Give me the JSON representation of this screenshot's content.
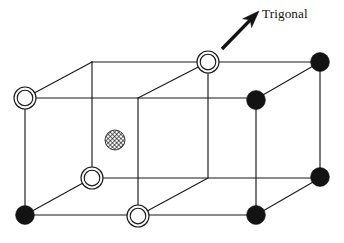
{
  "figure": {
    "kind": "crystal-lattice-diagram",
    "background_color": "#ffffff",
    "line_color": "#1a1a1a",
    "width": 344,
    "height": 243
  },
  "annotation": {
    "axis_label": "Trigonal",
    "arrow": {
      "tail_x": 222,
      "tail_y": 49,
      "tip_x": 259,
      "tip_y": 11,
      "color": "#131313",
      "shaft_width": 3.4
    },
    "label_position": {
      "x": 262,
      "y": 6
    },
    "label_font_size": 13.2
  },
  "legend_semantics": {
    "filled_circle": "filled-atom",
    "double_circle": "open-atom",
    "hatched_circle": "interstitial-atom"
  },
  "chart_data": {
    "type": "scatter",
    "title": "Trigonal",
    "xlabel": "",
    "ylabel": "",
    "projection": "oblique",
    "depth_offset": {
      "dx": 67,
      "dy": -36
    },
    "cell_geometry": {
      "front_face_left": 25,
      "front_face_right": 256,
      "front_face_top": 98,
      "front_face_bottom": 215,
      "front_mid_x": 138,
      "back_face_left": 92,
      "back_face_right": 320,
      "back_face_top": 62,
      "back_face_bottom": 177,
      "back_mid_x": 208
    },
    "atoms": [
      {
        "id": "back-top-left",
        "x": 92,
        "y": 62,
        "type": "vertex-plain",
        "r": 0
      },
      {
        "id": "back-top-mid",
        "x": 208,
        "y": 62,
        "type": "open",
        "r": 11
      },
      {
        "id": "back-top-right",
        "x": 320,
        "y": 62,
        "type": "filled",
        "r": 9.4
      },
      {
        "id": "front-top-left",
        "x": 25,
        "y": 98,
        "type": "open",
        "r": 11
      },
      {
        "id": "front-top-mid",
        "x": 138,
        "y": 98,
        "type": "vertex-plain",
        "r": 0
      },
      {
        "id": "front-top-right",
        "x": 256,
        "y": 100,
        "type": "filled",
        "r": 9.4
      },
      {
        "id": "cell-center",
        "x": 115,
        "y": 140,
        "type": "hatched",
        "r": 10
      },
      {
        "id": "back-bottom-left",
        "x": 92,
        "y": 178,
        "type": "open",
        "r": 11
      },
      {
        "id": "back-bottom-mid",
        "x": 208,
        "y": 177,
        "type": "vertex-plain",
        "r": 0
      },
      {
        "id": "back-bottom-right",
        "x": 320,
        "y": 177,
        "type": "filled",
        "r": 9.4
      },
      {
        "id": "front-bottom-left",
        "x": 25,
        "y": 215,
        "type": "filled",
        "r": 9.4
      },
      {
        "id": "front-bottom-mid",
        "x": 138,
        "y": 216,
        "type": "open",
        "r": 11
      },
      {
        "id": "front-bottom-right",
        "x": 256,
        "y": 215,
        "type": "filled",
        "r": 9.4
      }
    ],
    "edges": [
      {
        "id": "front-top-rail",
        "x1": 25,
        "y1": 98,
        "x2": 256,
        "y2": 98
      },
      {
        "id": "front-bottom-rail",
        "x1": 25,
        "y1": 215,
        "x2": 256,
        "y2": 215
      },
      {
        "id": "front-left-post",
        "x1": 25,
        "y1": 98,
        "x2": 25,
        "y2": 215
      },
      {
        "id": "front-mid-post",
        "x1": 138,
        "y1": 98,
        "x2": 138,
        "y2": 216
      },
      {
        "id": "front-right-post",
        "x1": 256,
        "y1": 98,
        "x2": 256,
        "y2": 215
      },
      {
        "id": "back-top-rail",
        "x1": 92,
        "y1": 62,
        "x2": 320,
        "y2": 62
      },
      {
        "id": "back-bottom-rail",
        "x1": 92,
        "y1": 178,
        "x2": 320,
        "y2": 178
      },
      {
        "id": "back-left-post",
        "x1": 92,
        "y1": 62,
        "x2": 92,
        "y2": 178
      },
      {
        "id": "back-mid-post",
        "x1": 208,
        "y1": 62,
        "x2": 208,
        "y2": 177
      },
      {
        "id": "back-right-post",
        "x1": 320,
        "y1": 62,
        "x2": 320,
        "y2": 178
      },
      {
        "id": "depth-top-left",
        "x1": 25,
        "y1": 98,
        "x2": 92,
        "y2": 62
      },
      {
        "id": "depth-top-mid",
        "x1": 138,
        "y1": 98,
        "x2": 208,
        "y2": 62
      },
      {
        "id": "depth-top-right",
        "x1": 256,
        "y1": 99,
        "x2": 320,
        "y2": 62
      },
      {
        "id": "depth-bottom-left",
        "x1": 25,
        "y1": 215,
        "x2": 92,
        "y2": 178
      },
      {
        "id": "depth-bottom-mid",
        "x1": 138,
        "y1": 216,
        "x2": 208,
        "y2": 178
      },
      {
        "id": "depth-bottom-right",
        "x1": 256,
        "y1": 215,
        "x2": 320,
        "y2": 178
      }
    ]
  }
}
